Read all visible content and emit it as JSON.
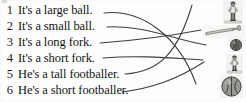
{
  "exercise": {
    "type": "matching",
    "instruction_visible": false,
    "ink_color": "#3a3a3a",
    "text_color": "#141414",
    "background_color": "#fdfdfd"
  },
  "sentences": [
    {
      "number": "1",
      "text": "It's a large ball."
    },
    {
      "number": "2",
      "text": "It's a small ball."
    },
    {
      "number": "3",
      "text": "It's a long fork."
    },
    {
      "number": "4",
      "text": "It's a short fork."
    },
    {
      "number": "5",
      "text": "He's a tall footballer."
    },
    {
      "number": "6",
      "text": "He's a short footballer."
    }
  ],
  "pictures": [
    {
      "id": "a",
      "name": "tall-footballer-photo",
      "label": "tall footballer"
    },
    {
      "id": "b",
      "name": "long-fork-photo",
      "label": "long fork"
    },
    {
      "id": "c",
      "name": "small-ball-photo",
      "label": "small ball"
    },
    {
      "id": "d",
      "name": "short-footballer-photo",
      "label": "short footballer"
    },
    {
      "id": "e",
      "name": "large-ball-photo",
      "label": "large ball"
    }
  ],
  "connections": [
    {
      "from_sentence": "1",
      "to_picture": "e",
      "label": "line-1-to-large-ball"
    },
    {
      "from_sentence": "2",
      "to_picture": "c",
      "label": "line-2-to-small-ball"
    },
    {
      "from_sentence": "3",
      "to_picture": "b",
      "label": "line-3-to-long-fork"
    },
    {
      "from_sentence": "4",
      "to_picture": "d",
      "label": "line-4-to-short-fork"
    },
    {
      "from_sentence": "5",
      "to_picture": "a",
      "label": "line-5-to-tall-footballer"
    },
    {
      "from_sentence": "6",
      "to_picture": "d",
      "label": "line-6-to-short-footballer"
    }
  ]
}
